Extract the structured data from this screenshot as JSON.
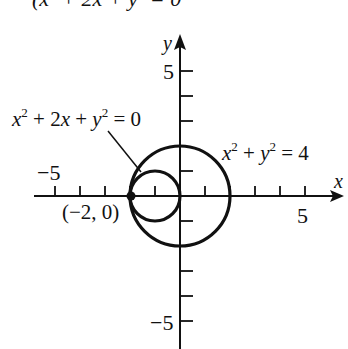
{
  "header_cutoff": "(x² + 2x + y² = 0",
  "axes": {
    "x_label": "x",
    "y_label": "y",
    "x_tick_labels": {
      "neg": "−5",
      "pos": "5"
    },
    "y_tick_labels": {
      "pos": "5",
      "neg": "−5"
    }
  },
  "curves": {
    "small_circle": {
      "equation_label": "x² + 2x + y² = 0",
      "center": [
        -1,
        0
      ],
      "radius": 1
    },
    "large_circle": {
      "equation_label": "x² + y² = 4",
      "center": [
        0,
        0
      ],
      "radius": 2
    }
  },
  "point": {
    "label": "(−2, 0)",
    "coords": [
      -2,
      0
    ]
  },
  "colors": {
    "ink": "#111111",
    "background": "#ffffff"
  }
}
